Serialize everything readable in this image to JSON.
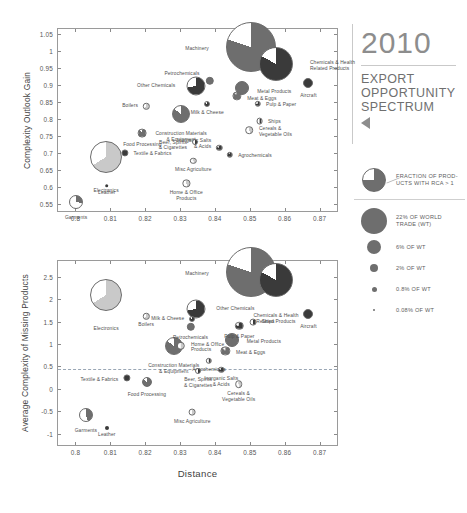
{
  "header": {
    "year": "2010",
    "subtitle_lines": [
      "EXPORT",
      "OPPORTUNITY",
      "SPECTRUM"
    ],
    "nav_icon": "triangle-left-icon"
  },
  "legend": {
    "pie_note_lines": [
      "FRACTION OF PROD-",
      "UCTS WITH RCA > 1"
    ],
    "sizes": [
      {
        "label_lines": [
          "22% OF WORLD",
          "TRADE (WT)"
        ],
        "px": 26
      },
      {
        "label_lines": [
          "6% OF WT"
        ],
        "px": 14
      },
      {
        "label_lines": [
          "2% OF WT"
        ],
        "px": 8.5
      },
      {
        "label_lines": [
          "0.8% OF WT"
        ],
        "px": 5
      },
      {
        "label_lines": [
          "0.08% OF WT"
        ],
        "px": 2
      }
    ]
  },
  "colors": {
    "bubble_dark": "#3a3a3a",
    "bubble_mid": "#6e6e6e",
    "bubble_light": "#c9c9c9",
    "empty": "#ffffff",
    "axis": "#9a9a9a",
    "refline": "#9aa7b5",
    "title_gray": "#8d8d8d"
  },
  "chart_data": [
    {
      "id": "top",
      "type": "scatter",
      "title": "",
      "xlabel": "",
      "ylabel": "Complexity Outlook Gain",
      "xlim": [
        0.795,
        0.875
      ],
      "ylim": [
        0.53,
        1.065
      ],
      "xticks": [
        "0.8",
        "0.81",
        "0.82",
        "0.83",
        "0.84",
        "0.85",
        "0.86",
        "0.87"
      ],
      "xtickvals": [
        0.8,
        0.81,
        0.82,
        0.83,
        0.84,
        0.85,
        0.86,
        0.87
      ],
      "yticks": [
        "0.55",
        "0.6",
        "0.65",
        "0.7",
        "0.75",
        "0.8",
        "0.85",
        "0.9",
        "0.95",
        "1",
        "1.05"
      ],
      "ytickvals": [
        0.55,
        0.6,
        0.65,
        0.7,
        0.75,
        0.8,
        0.85,
        0.9,
        0.95,
        1.0,
        1.05
      ],
      "grid": false,
      "legend_position": "right-outside",
      "points": [
        {
          "name": "Machinery",
          "x": 0.8503,
          "y": 1.012,
          "r": 25,
          "share": 0.8,
          "tone": "mid",
          "lab": "l",
          "lx": -17,
          "ly": 2
        },
        {
          "name": "Chemicals & Health\nRelated Products",
          "x": 0.8575,
          "y": 0.962,
          "r": 17,
          "share": 0.83,
          "tone": "dark",
          "lab": "r",
          "lx": 17,
          "ly": 2
        },
        {
          "name": "Petrochemicals",
          "x": 0.8385,
          "y": 0.912,
          "r": 4.2,
          "share": 1.0,
          "tone": "mid",
          "lab": "l",
          "lx": -6,
          "ly": -7
        },
        {
          "name": "Other Chemicals",
          "x": 0.8345,
          "y": 0.896,
          "r": 9.5,
          "share": 0.72,
          "tone": "dark",
          "lab": "l",
          "lx": -11,
          "ly": 0
        },
        {
          "name": "Aircraft",
          "x": 0.8668,
          "y": 0.905,
          "r": 5.0,
          "share": 1.0,
          "tone": "dark",
          "lab": "c",
          "lx": 0,
          "ly": 7
        },
        {
          "name": "Metal Products",
          "x": 0.8478,
          "y": 0.893,
          "r": 7.0,
          "share": 1.0,
          "tone": "mid",
          "lab": "r",
          "lx": 8,
          "ly": 4
        },
        {
          "name": "Meat & Eggs",
          "x": 0.8462,
          "y": 0.868,
          "r": 4.6,
          "share": 0.88,
          "tone": "mid",
          "lab": "r",
          "lx": 6,
          "ly": 3
        },
        {
          "name": "Pulp & Paper",
          "x": 0.8523,
          "y": 0.845,
          "r": 3.2,
          "share": 0.78,
          "tone": "dark",
          "lab": "r",
          "lx": 5,
          "ly": 1
        },
        {
          "name": "Milk & Cheese",
          "x": 0.8378,
          "y": 0.845,
          "r": 3.0,
          "share": 0.85,
          "tone": "dark",
          "lab": "c",
          "lx": 0,
          "ly": 5
        },
        {
          "name": "Boilers",
          "x": 0.8203,
          "y": 0.838,
          "r": 3.2,
          "share": 0.62,
          "tone": "light",
          "lab": "l",
          "lx": -5,
          "ly": 0
        },
        {
          "name": "Construction Materials\n& Equipment",
          "x": 0.8303,
          "y": 0.815,
          "r": 9.0,
          "share": 0.85,
          "tone": "mid",
          "lab": "c",
          "lx": 0,
          "ly": 10
        },
        {
          "name": "Ships",
          "x": 0.8528,
          "y": 0.794,
          "r": 3.4,
          "share": 0.5,
          "tone": "dark",
          "lab": "r",
          "lx": 5,
          "ly": 1
        },
        {
          "name": "Cereals &\nVegetable Oils",
          "x": 0.8498,
          "y": 0.767,
          "r": 3.8,
          "share": 0.45,
          "tone": "light",
          "lab": "r",
          "lx": 6,
          "ly": 2
        },
        {
          "name": "Food Processing",
          "x": 0.8192,
          "y": 0.758,
          "r": 4.4,
          "share": 0.88,
          "tone": "mid",
          "lab": "c",
          "lx": 0,
          "ly": 6
        },
        {
          "name": "Inorganic Salts\n& Acids",
          "x": 0.8413,
          "y": 0.715,
          "r": 3.2,
          "share": 0.8,
          "tone": "dark",
          "lab": "l",
          "lx": -5,
          "ly": -4
        },
        {
          "name": "Textile & Fabrics",
          "x": 0.8142,
          "y": 0.701,
          "r": 3.6,
          "share": 1.0,
          "tone": "dark",
          "lab": "r",
          "lx": 5,
          "ly": 1
        },
        {
          "name": "Beer, Spirits\n& Cigarettes",
          "x": 0.8343,
          "y": 0.734,
          "r": 3.0,
          "share": 0.55,
          "tone": "dark",
          "lab": "l",
          "lx": -5,
          "ly": 4
        },
        {
          "name": "Agrochemicals",
          "x": 0.8443,
          "y": 0.695,
          "r": 3.2,
          "share": 0.9,
          "tone": "dark",
          "lab": "r",
          "lx": 5,
          "ly": 1
        },
        {
          "name": "Electronics",
          "x": 0.8088,
          "y": 0.688,
          "r": 16,
          "share": 0.66,
          "tone": "light",
          "lab": "c",
          "lx": 0,
          "ly": 17
        },
        {
          "name": "Misc Agriculture",
          "x": 0.8338,
          "y": 0.678,
          "r": 3.2,
          "share": 0.5,
          "tone": "light",
          "lab": "c",
          "lx": 0,
          "ly": 5
        },
        {
          "name": "Home & Office\nProducts",
          "x": 0.8318,
          "y": 0.611,
          "r": 3.6,
          "share": 0.45,
          "tone": "light",
          "lab": "c",
          "lx": 0,
          "ly": 5
        },
        {
          "name": "Leather",
          "x": 0.809,
          "y": 0.604,
          "r": 1.8,
          "share": 1.0,
          "tone": "dark",
          "lab": "c",
          "lx": 0,
          "ly": 4
        },
        {
          "name": "Garments",
          "x": 0.8002,
          "y": 0.556,
          "r": 7.0,
          "share": 0.28,
          "tone": "mid",
          "lab": "c",
          "lx": 0,
          "ly": 8
        }
      ]
    },
    {
      "id": "bottom",
      "type": "scatter",
      "title": "",
      "xlabel": "Distance",
      "ylabel": "Average Complexity of Missing Products",
      "xlim": [
        0.795,
        0.875
      ],
      "ylim": [
        -1.25,
        2.85
      ],
      "xticks": [
        "0.8",
        "0.81",
        "0.82",
        "0.83",
        "0.84",
        "0.85",
        "0.86",
        "0.87"
      ],
      "xtickvals": [
        0.8,
        0.81,
        0.82,
        0.83,
        0.84,
        0.85,
        0.86,
        0.87
      ],
      "yticks": [
        "2.5",
        "2",
        "1.5",
        "1",
        "0.5",
        "0",
        "-0.5",
        "-1"
      ],
      "ytickvals": [
        2.5,
        2.0,
        1.5,
        1.0,
        0.5,
        0.0,
        -0.5,
        -1.0
      ],
      "refline_y": 0.45,
      "grid": false,
      "legend_position": "right-outside",
      "points": [
        {
          "name": "Machinery",
          "x": 0.8503,
          "y": 2.6,
          "r": 25,
          "share": 0.8,
          "tone": "mid",
          "lab": "l",
          "lx": -17,
          "ly": 2
        },
        {
          "name": "Chemicals & Health\nRelated Products",
          "x": 0.8575,
          "y": 2.42,
          "r": 17,
          "share": 0.83,
          "tone": "dark",
          "lab": "c",
          "lx": 0,
          "ly": 18
        },
        {
          "name": "Electronics",
          "x": 0.8088,
          "y": 2.1,
          "r": 16,
          "share": 0.66,
          "tone": "light",
          "lab": "c",
          "lx": 0,
          "ly": 17
        },
        {
          "name": "Other Chemicals",
          "x": 0.8345,
          "y": 1.78,
          "r": 9.5,
          "share": 0.72,
          "tone": "dark",
          "lab": "r",
          "lx": 11,
          "ly": 0
        },
        {
          "name": "Aircraft",
          "x": 0.8668,
          "y": 1.66,
          "r": 5.0,
          "share": 1.0,
          "tone": "dark",
          "lab": "c",
          "lx": 0,
          "ly": 7
        },
        {
          "name": "Boilers",
          "x": 0.8203,
          "y": 1.62,
          "r": 3.2,
          "share": 0.62,
          "tone": "light",
          "lab": "c",
          "lx": 0,
          "ly": 5
        },
        {
          "name": "Milk & Cheese",
          "x": 0.8335,
          "y": 1.55,
          "r": 3.0,
          "share": 0.85,
          "tone": "dark",
          "lab": "l",
          "lx": -5,
          "ly": 0
        },
        {
          "name": "Ships",
          "x": 0.851,
          "y": 1.48,
          "r": 3.4,
          "share": 0.5,
          "tone": "dark",
          "lab": "r",
          "lx": 5,
          "ly": 0
        },
        {
          "name": "Pulp & Paper",
          "x": 0.847,
          "y": 1.4,
          "r": 4.2,
          "share": 0.78,
          "tone": "dark",
          "lab": "c",
          "lx": 0,
          "ly": 6
        },
        {
          "name": "Petrochemicals",
          "x": 0.833,
          "y": 1.38,
          "r": 4.2,
          "share": 1.0,
          "tone": "mid",
          "lab": "c",
          "lx": 0,
          "ly": 6
        },
        {
          "name": "Metal Products",
          "x": 0.8448,
          "y": 1.1,
          "r": 7.0,
          "share": 1.0,
          "tone": "mid",
          "lab": "r",
          "lx": 8,
          "ly": 2
        },
        {
          "name": "Home & Office\nProducts",
          "x": 0.8302,
          "y": 0.96,
          "r": 4.2,
          "share": 0.45,
          "tone": "light",
          "lab": "r",
          "lx": 6,
          "ly": 2
        },
        {
          "name": "Construction Materials\n& Equipment",
          "x": 0.8282,
          "y": 0.95,
          "r": 9.0,
          "share": 0.85,
          "tone": "mid",
          "lab": "c",
          "lx": 0,
          "ly": 10
        },
        {
          "name": "Meat & Eggs",
          "x": 0.843,
          "y": 0.85,
          "r": 4.6,
          "share": 0.88,
          "tone": "mid",
          "lab": "r",
          "lx": 6,
          "ly": 2
        },
        {
          "name": "Agrochemicals",
          "x": 0.8383,
          "y": 0.63,
          "r": 3.2,
          "share": 0.55,
          "tone": "dark",
          "lab": "c",
          "lx": 0,
          "ly": 5
        },
        {
          "name": "Inorganic Salts\n& Acids",
          "x": 0.8418,
          "y": 0.42,
          "r": 3.2,
          "share": 0.8,
          "tone": "dark",
          "lab": "c",
          "lx": 0,
          "ly": 5
        },
        {
          "name": "Beer, Spirits\n& Cigarettes",
          "x": 0.8352,
          "y": 0.4,
          "r": 3.0,
          "share": 0.55,
          "tone": "dark",
          "lab": "c",
          "lx": 0,
          "ly": 5
        },
        {
          "name": "Cereals &\nVegetable Oils",
          "x": 0.8468,
          "y": 0.1,
          "r": 3.8,
          "share": 0.45,
          "tone": "light",
          "lab": "c",
          "lx": 0,
          "ly": 5
        },
        {
          "name": "Textile & Fabrics",
          "x": 0.8148,
          "y": 0.25,
          "r": 3.6,
          "share": 1.0,
          "tone": "dark",
          "lab": "l",
          "lx": -5,
          "ly": 2
        },
        {
          "name": "Food Processing",
          "x": 0.8205,
          "y": 0.16,
          "r": 5.0,
          "share": 0.85,
          "tone": "mid",
          "lab": "c",
          "lx": 0,
          "ly": 7
        },
        {
          "name": "Misc Agriculture",
          "x": 0.8335,
          "y": -0.52,
          "r": 3.4,
          "share": 0.5,
          "tone": "light",
          "lab": "c",
          "lx": 0,
          "ly": 5
        },
        {
          "name": "Garments",
          "x": 0.803,
          "y": -0.58,
          "r": 7.0,
          "share": 0.45,
          "tone": "mid",
          "lab": "c",
          "lx": 0,
          "ly": 8
        },
        {
          "name": "Leather",
          "x": 0.809,
          "y": -0.88,
          "r": 2.0,
          "share": 1.0,
          "tone": "dark",
          "lab": "c",
          "lx": 0,
          "ly": 4
        }
      ]
    }
  ]
}
